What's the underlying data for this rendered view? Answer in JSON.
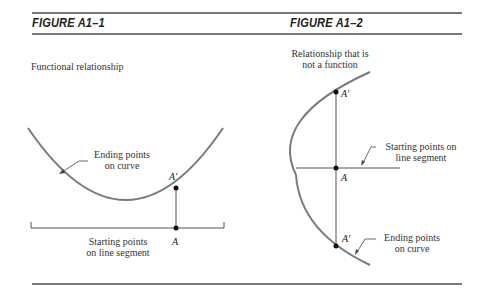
{
  "figures": [
    {
      "title": "FIGURE A1–1",
      "subtitle": "Functional relationship",
      "curve_label": [
        "Ending points",
        "on curve"
      ],
      "segment_label": [
        "Starting points",
        "on line segment"
      ],
      "point_start": "A",
      "point_end": "A′"
    },
    {
      "title": "FIGURE A1–2",
      "subtitle": [
        "Relationship that is",
        "not a function"
      ],
      "segment_label": [
        "Starting points on",
        "line segment"
      ],
      "curve_label": [
        "Ending points",
        "on curve"
      ],
      "point_start": "A",
      "point_end_top": "A′",
      "point_end_bottom": "A′"
    }
  ],
  "colors": {
    "curve": "#7a7a7a",
    "line": "#555555",
    "point": "#111111",
    "rule": "#777777"
  }
}
